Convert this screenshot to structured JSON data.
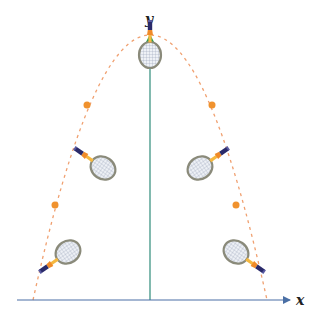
{
  "diagram": {
    "axes": {
      "x_label": "x",
      "y_label": "y",
      "x_axis_color": "#4a6fa5",
      "y_axis_color": "#2e8b7a",
      "y_arrow_color": "#2e9e4a"
    },
    "trajectory": {
      "type": "parabola",
      "style": "dashed",
      "color": "#f0a070",
      "apex": [
        150,
        35
      ],
      "roots_px": [
        33,
        267
      ],
      "baseline_px": 300
    },
    "markers": {
      "color": "#f0922e",
      "points": [
        [
          87,
          105
        ],
        [
          212,
          105
        ],
        [
          55,
          205
        ],
        [
          236,
          205
        ]
      ]
    },
    "rackets": [
      {
        "id": "apex",
        "cx": 150,
        "cy": 54,
        "rotation": 0
      },
      {
        "id": "left-mid",
        "cx": 103,
        "cy": 168,
        "rotation": -40
      },
      {
        "id": "right-mid",
        "cx": 200,
        "cy": 168,
        "rotation": 40
      },
      {
        "id": "left-low",
        "cx": 67,
        "cy": 253,
        "rotation": 50
      },
      {
        "id": "right-low",
        "cx": 237,
        "cy": 253,
        "rotation": -50
      }
    ],
    "colors": {
      "frame": "#8a8a7a",
      "strings": "#c0c8d8",
      "shaft": "#f5b840",
      "throat": "#f08a28",
      "grip": "#2a2a6a",
      "grip_end": "#5a5aa0"
    }
  }
}
